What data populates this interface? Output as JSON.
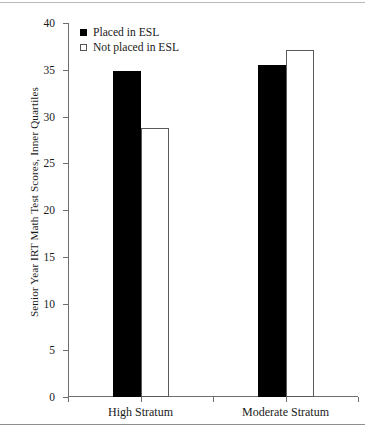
{
  "chart_data": {
    "type": "bar",
    "title": "",
    "subtitle": "",
    "xlabel": "",
    "ylabel": "Senior Year IRT Math Test Scores, Inner Quartiles",
    "categories": [
      "High Stratum",
      "Moderate Stratum"
    ],
    "series": [
      {
        "name": "Placed in ESL",
        "swatch": "filled",
        "color": "#000000",
        "values": [
          34.9,
          35.5
        ]
      },
      {
        "name": "Not placed in ESL",
        "swatch": "open",
        "color": "#ffffff",
        "values": [
          28.8,
          37.1
        ]
      }
    ],
    "ylim": [
      0,
      40
    ],
    "ytick_labels": [
      "0",
      "5",
      "10",
      "15",
      "20",
      "25",
      "30",
      "35",
      "40"
    ],
    "ytick_values": [
      0,
      5,
      10,
      15,
      20,
      25,
      30,
      35,
      40
    ],
    "grid": false,
    "legend_position": "top-left-inside"
  },
  "legend": {
    "entries": [
      {
        "label": "Placed in ESL",
        "swatch": "filled"
      },
      {
        "label": "Not placed in ESL",
        "swatch": "open"
      }
    ]
  },
  "axes": {
    "y_title": "Senior Year IRT Math Test Scores, Inner Quartiles"
  }
}
